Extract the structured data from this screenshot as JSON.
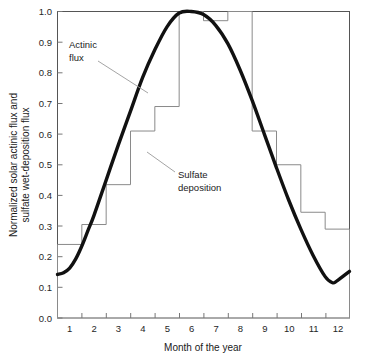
{
  "chart_data": {
    "type": "line",
    "title": "",
    "xlabel": "Month of the year",
    "ylabel": "Normalized solar actinic flux and sulfate wet-deposition flux",
    "xlim": [
      0.5,
      12.5
    ],
    "ylim": [
      0.0,
      1.0
    ],
    "grid": false,
    "legend_position": "none",
    "x_tick_labels": [
      "1",
      "2",
      "3",
      "4",
      "5",
      "6",
      "7",
      "8",
      "9",
      "10",
      "11",
      "12"
    ],
    "x_tick_values": [
      1,
      2,
      3,
      4,
      5,
      6,
      7,
      8,
      9,
      10,
      11,
      12
    ],
    "y_tick_labels": [
      "0.0",
      "0.1",
      "0.2",
      "0.3",
      "0.4",
      "0.5",
      "0.6",
      "0.7",
      "0.8",
      "0.9",
      "1.0"
    ],
    "y_tick_values": [
      0.0,
      0.1,
      0.2,
      0.3,
      0.4,
      0.5,
      0.6,
      0.7,
      0.8,
      0.9,
      1.0
    ],
    "series": [
      {
        "name": "Actinic flux",
        "style": "smooth-thick-line",
        "x": [
          0.5,
          0.75,
          1.0,
          1.25,
          1.5,
          1.75,
          2.0,
          2.5,
          3.0,
          3.5,
          4.0,
          4.5,
          5.0,
          5.5,
          6.0,
          6.5,
          7.0,
          7.5,
          8.0,
          8.5,
          9.0,
          9.5,
          10.0,
          10.5,
          11.0,
          11.5,
          11.8,
          12.0,
          12.5
        ],
        "values": [
          0.142,
          0.148,
          0.163,
          0.193,
          0.235,
          0.285,
          0.335,
          0.45,
          0.565,
          0.675,
          0.785,
          0.875,
          0.95,
          0.995,
          1.0,
          0.99,
          0.955,
          0.895,
          0.81,
          0.71,
          0.6,
          0.49,
          0.385,
          0.29,
          0.205,
          0.135,
          0.115,
          0.122,
          0.152
        ]
      },
      {
        "name": "Sulfate deposition",
        "style": "step-thin-line",
        "x": [
          1,
          2,
          3,
          4,
          5,
          6,
          7,
          8,
          9,
          10,
          11,
          12
        ],
        "values": [
          0.24,
          0.305,
          0.435,
          0.61,
          0.69,
          1.0,
          0.97,
          1.0,
          0.61,
          0.5,
          0.345,
          0.29
        ]
      }
    ],
    "annotations": [
      {
        "name": "actinic-flux-label",
        "text_lines": [
          "Actinic",
          "flux"
        ],
        "text": "Actinic flux",
        "x": 0.2,
        "y": 0.81
      },
      {
        "name": "sulfate-deposition-label",
        "text_lines": [
          "Sulfate",
          "deposition"
        ],
        "text": "Sulfate deposition",
        "x": 0.52,
        "y": 0.48
      }
    ]
  },
  "axes": {
    "y_label_line1": "Normalized solar actinic flux and",
    "y_label_line2": "sulfate wet-deposition flux",
    "x_label": "Month of the year"
  },
  "annotations": {
    "actinic_line1": "Actinic",
    "actinic_line2": "flux",
    "sulfate_line1": "Sulfate",
    "sulfate_line2": "deposition"
  },
  "colors": {
    "flux_line": "#111111",
    "step_line": "#8a8a8a",
    "frame": "#555555",
    "text": "#1a1a1a",
    "background": "#ffffff"
  }
}
